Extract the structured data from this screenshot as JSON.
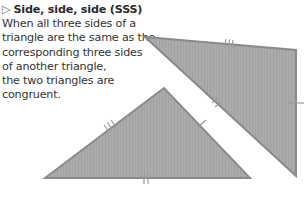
{
  "heading": {
    "marker": "▷",
    "title": "Side, side, side (SSS)"
  },
  "body_lines": [
    "When all three sides of a",
    "triangle are the same as the",
    "corresponding three sides",
    "of another triangle,",
    "the two triangles are",
    "congruent."
  ],
  "colors": {
    "fill": "#a9a9a9",
    "stroke": "#8a8a8a",
    "text": "#333333"
  },
  "triangles": [
    {
      "name": "left-triangle",
      "vertices": [
        [
          45,
          178
        ],
        [
          164,
          88
        ],
        [
          250,
          178
        ]
      ],
      "marks": {
        "left_side": 3,
        "right_side": 1,
        "base": 2
      }
    },
    {
      "name": "right-triangle",
      "vertices": [
        [
          145,
          37
        ],
        [
          296,
          50
        ],
        [
          296,
          176
        ]
      ],
      "marks": {
        "top_side": 3,
        "right_side": 1,
        "hypotenuse": 2
      }
    }
  ]
}
